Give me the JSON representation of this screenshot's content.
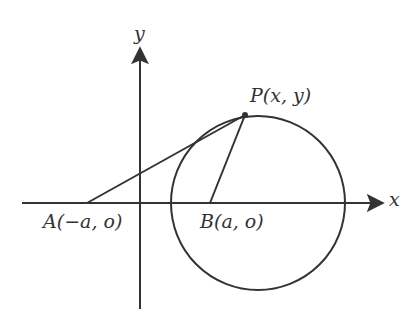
{
  "diagram": {
    "axes": {
      "x_label": "x",
      "y_label": "y"
    },
    "points": {
      "A": {
        "label": "A(−a, o)"
      },
      "B": {
        "label": "B(a, o)"
      },
      "P": {
        "label": "P(x, y)"
      }
    },
    "elements": [
      "x-axis with arrow",
      "y-axis with arrow",
      "circle centered right of B passing through P",
      "segment A to P",
      "segment B to P"
    ],
    "colors": {
      "stroke": "#333333",
      "background": "#ffffff"
    }
  }
}
